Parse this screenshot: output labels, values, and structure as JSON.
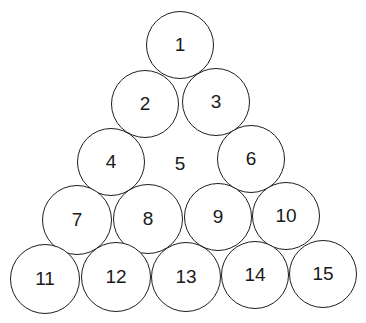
{
  "diagram": {
    "title": "",
    "stroke_color": "#1e1e1e",
    "background": "#ffffff",
    "circles": [
      {
        "label": "1",
        "cx": 180,
        "cy": 45,
        "r": 34,
        "outlined": true
      },
      {
        "label": "2",
        "cx": 145,
        "cy": 104,
        "r": 34,
        "outlined": true
      },
      {
        "label": "3",
        "cx": 216,
        "cy": 102,
        "r": 34,
        "outlined": true
      },
      {
        "label": "4",
        "cx": 111,
        "cy": 162,
        "r": 34,
        "outlined": true
      },
      {
        "label": "5",
        "cx": 180,
        "cy": 164,
        "r": 34,
        "outlined": false
      },
      {
        "label": "6",
        "cx": 251,
        "cy": 159,
        "r": 34,
        "outlined": true
      },
      {
        "label": "7",
        "cx": 77,
        "cy": 220,
        "r": 35,
        "outlined": true
      },
      {
        "label": "8",
        "cx": 148,
        "cy": 219,
        "r": 35,
        "outlined": true
      },
      {
        "label": "9",
        "cx": 218,
        "cy": 217,
        "r": 34,
        "outlined": true
      },
      {
        "label": "10",
        "cx": 286,
        "cy": 216,
        "r": 34,
        "outlined": true
      },
      {
        "label": "11",
        "cx": 45,
        "cy": 279,
        "r": 35,
        "outlined": true
      },
      {
        "label": "12",
        "cx": 116,
        "cy": 277,
        "r": 35,
        "outlined": true
      },
      {
        "label": "13",
        "cx": 186,
        "cy": 277,
        "r": 35,
        "outlined": true
      },
      {
        "label": "14",
        "cx": 255,
        "cy": 275,
        "r": 34,
        "outlined": true
      },
      {
        "label": "15",
        "cx": 323,
        "cy": 274,
        "r": 34,
        "outlined": true
      }
    ]
  }
}
